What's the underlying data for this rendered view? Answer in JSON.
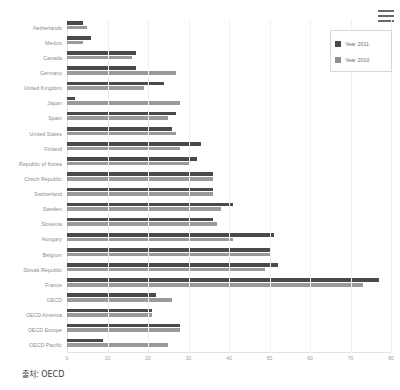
{
  "menu": {
    "name": "chart-menu",
    "label": "menu"
  },
  "legend": {
    "position": "top-right",
    "items": [
      {
        "label": "Year 2011",
        "color": "#4a4a4a"
      },
      {
        "label": "Year 2010",
        "color": "#8f8f8f"
      }
    ]
  },
  "caption": {
    "text": "출처: OECD"
  },
  "chart_data": {
    "type": "bar",
    "orientation": "horizontal",
    "title": "",
    "subtitle": "",
    "xlabel": "",
    "ylabel": "",
    "xlim": [
      0,
      80
    ],
    "xticks": [
      0,
      10,
      20,
      30,
      40,
      50,
      60,
      70,
      80
    ],
    "grid": true,
    "grid_axis": "x",
    "legend_position": "top-right",
    "categories": [
      "Netherlands",
      "Mexico",
      "Canada",
      "Germany",
      "United Kingdom",
      "Japan",
      "Spain",
      "United States",
      "Finland",
      "Republic of Korea",
      "Czech Republic",
      "Switzerland",
      "Sweden",
      "Slovenia",
      "Hungary",
      "Belgium",
      "Slovak Republic",
      "France",
      "OECD",
      "OECD America",
      "OECD Europe",
      "OECD Pacific"
    ],
    "series": [
      {
        "name": "Year 2011",
        "color": "#4a4a4a",
        "values": [
          4,
          6,
          17,
          17,
          24,
          2,
          27,
          26,
          33,
          32,
          36,
          36,
          41,
          36,
          51,
          50,
          52,
          77,
          22,
          21,
          28,
          9
        ]
      },
      {
        "name": "Year 2010",
        "color": "#9a9a9a",
        "values": [
          5,
          4,
          16,
          27,
          19,
          28,
          25,
          27,
          28,
          30,
          36,
          36,
          38,
          37,
          41,
          50,
          49,
          73,
          26,
          21,
          28,
          25
        ]
      }
    ]
  },
  "source": {
    "label": "OECD"
  }
}
